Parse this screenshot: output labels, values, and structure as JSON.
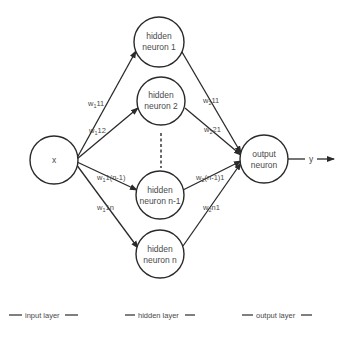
{
  "diagram": {
    "input": {
      "label": "x"
    },
    "hidden": [
      {
        "line1": "hidden",
        "line2": "neuron 1"
      },
      {
        "line1": "hidden",
        "line2": "neuron 2"
      },
      {
        "line1": "hidden",
        "line2": "neuron n-1"
      },
      {
        "line1": "hidden",
        "line2": "neuron n"
      }
    ],
    "output": {
      "line1": "output",
      "line2": "neuron",
      "result": "y"
    },
    "weights_in": [
      {
        "w": "w",
        "sub": "1",
        "idx": "11"
      },
      {
        "w": "w",
        "sub": "1",
        "idx": "12"
      },
      {
        "w": "w",
        "sub": "1",
        "idx": "1(n-1)"
      },
      {
        "w": "w",
        "sub": "1",
        "idx": "1n"
      }
    ],
    "weights_out": [
      {
        "w": "w",
        "sub": "2",
        "idx": "11"
      },
      {
        "w": "w",
        "sub": "2",
        "idx": "21"
      },
      {
        "w": "w",
        "sub": "2",
        "idx": "(n-1)1"
      },
      {
        "w": "w",
        "sub": "2",
        "idx": "n1"
      }
    ]
  },
  "legend": {
    "input_layer": "input layer",
    "hidden_layer": "hidden layer",
    "output_layer": "output layer"
  },
  "colors": {
    "stroke": "#2a2a2a",
    "text": "#4a4a4a",
    "background": "#ffffff"
  }
}
